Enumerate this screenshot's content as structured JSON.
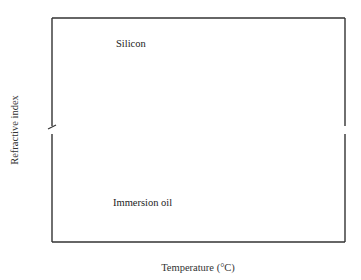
{
  "chart_data": {
    "type": "line",
    "title": "",
    "xlabel": "Temperature (°C)",
    "ylabel": "Refractive index",
    "xlim": [
      10,
      75
    ],
    "xticks": [
      10,
      20,
      30,
      40,
      50,
      60,
      70
    ],
    "broken_y_axis": true,
    "y_segments": [
      {
        "name": "upper",
        "ylim": [
          3.481,
          3.502
        ],
        "yticks": [
          "3.500",
          "3.495",
          "3.490",
          "3.485"
        ]
      },
      {
        "name": "lower",
        "ylim": [
          1.4848,
          1.5065
        ],
        "yticks": [
          "1.505",
          "1.500",
          "1.495",
          "1.490",
          "1.485"
        ]
      }
    ],
    "grid": false,
    "legend": "inline labels",
    "series": [
      {
        "name": "Silicon",
        "color": "#222222",
        "x": [
          19,
          25,
          30,
          35,
          40,
          45,
          50,
          55,
          60,
          65,
          70
        ],
        "y": [
          3.4902,
          3.4915,
          3.4925,
          3.4935,
          3.4946,
          3.4957,
          3.4967,
          3.4977,
          3.4988,
          3.4998,
          3.5008
        ]
      },
      {
        "name": "Immersion oil",
        "color": "#6e6e6e",
        "x": [
          19,
          25,
          30,
          35,
          40,
          45,
          50,
          55,
          60,
          65,
          70
        ],
        "y": [
          1.5027,
          1.5011,
          1.4996,
          1.4983,
          1.4969,
          1.4955,
          1.4941,
          1.4927,
          1.4912,
          1.4898,
          1.4884
        ]
      }
    ]
  }
}
